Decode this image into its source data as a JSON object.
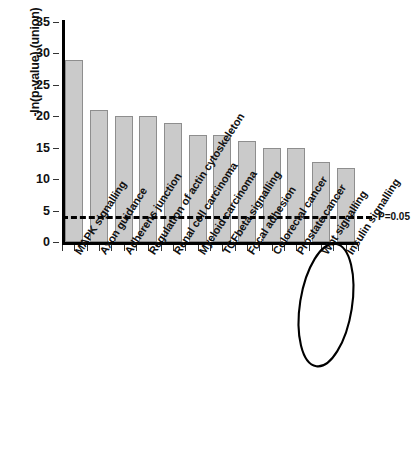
{
  "chart_data": {
    "type": "bar",
    "title": "",
    "xlabel": "",
    "ylabel": "-ln(p-value) (union)",
    "ylim": [
      0,
      35
    ],
    "yticks": [
      0,
      5,
      10,
      15,
      20,
      25,
      30,
      35
    ],
    "grid": false,
    "legend": null,
    "categories": [
      "MAPK signalling",
      "Axon guidance",
      "Adherens junction",
      "Regulation of actin cytoskeleton",
      "Renal cell carcinoma",
      "Myeloid carcinoma",
      "TGFbeta signalling",
      "Focal adhesion",
      "Colorectal cancer",
      "Prostate cancer",
      "Wnt signalling",
      "Insulin signalling"
    ],
    "values": [
      29,
      21,
      20,
      20,
      19,
      17,
      17,
      16,
      15,
      15,
      12.8,
      11.8
    ],
    "bar_color": "#cacaca",
    "bar_border_color": "#8e8e8e",
    "annotations": [
      {
        "name": "significance-threshold",
        "label": "P=0.05",
        "value": 4.1,
        "style": "dashed-horizontal-line"
      },
      {
        "name": "insulin-signalling-highlight",
        "label": "Insulin signalling",
        "style": "ellipse-outline"
      }
    ]
  }
}
